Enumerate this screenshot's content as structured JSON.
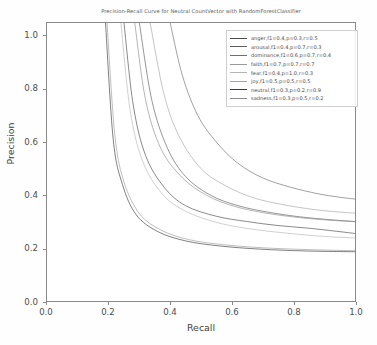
{
  "chart_data": {
    "type": "line",
    "title": "Precision-Recall Curve for Neutral  CountVector with RandomForestClassifier",
    "xlabel": "Recall",
    "ylabel": "Precision",
    "xlim": [
      0.0,
      1.0
    ],
    "ylim": [
      0.0,
      1.05
    ],
    "xticks": [
      "0.0",
      "0.2",
      "0.4",
      "0.6",
      "0.8",
      "1.0"
    ],
    "xtick_values": [
      0.0,
      0.2,
      0.4,
      0.6,
      0.8,
      1.0
    ],
    "yticks": [
      "0.0",
      "0.2",
      "0.4",
      "0.6",
      "0.8",
      "1.0"
    ],
    "ytick_values": [
      0.0,
      0.2,
      0.4,
      0.6,
      0.8,
      1.0
    ],
    "grid": false,
    "legend_position": "upper right",
    "series": [
      {
        "name": "anger,f1=0.4,p=0.3,r=0.5",
        "label": "anger,f1=0.4,p=0.3,r=0.5",
        "color": "#4a4a4a",
        "f1": 0.4,
        "precision": 0.3,
        "recall": 0.5,
        "asymptote_precision": 0.25,
        "knee_recall": 0.25,
        "x": [
          0.25,
          0.28,
          0.32,
          0.38,
          0.45,
          0.55,
          0.65,
          0.75,
          0.85,
          0.95,
          1.0
        ],
        "y": [
          1.05,
          0.74,
          0.55,
          0.43,
          0.36,
          0.32,
          0.3,
          0.285,
          0.275,
          0.262,
          0.255
        ]
      },
      {
        "name": "arousal,f1=0.4,p=0.7,r=0.3",
        "label": "arousal,f1=0.4,p=0.7,r=0.3",
        "color": "#5c5c5c",
        "f1": 0.4,
        "precision": 0.7,
        "recall": 0.3,
        "asymptote_precision": 0.3,
        "knee_recall": 0.3,
        "x": [
          0.3,
          0.34,
          0.39,
          0.45,
          0.53,
          0.62,
          0.72,
          0.82,
          0.92,
          1.0
        ],
        "y": [
          1.05,
          0.76,
          0.58,
          0.47,
          0.4,
          0.36,
          0.335,
          0.318,
          0.307,
          0.3
        ]
      },
      {
        "name": "dominance,f1=0.6,p=0.7,r=0.4",
        "label": "dominance,f1=0.6,p=0.7,r=0.4",
        "color": "#6e6e6e",
        "f1": 0.6,
        "precision": 0.7,
        "recall": 0.4,
        "asymptote_precision": 0.385,
        "knee_recall": 0.4,
        "x": [
          0.4,
          0.44,
          0.49,
          0.55,
          0.62,
          0.7,
          0.79,
          0.88,
          0.95,
          1.0
        ],
        "y": [
          1.05,
          0.85,
          0.7,
          0.6,
          0.52,
          0.465,
          0.43,
          0.405,
          0.392,
          0.385
        ]
      },
      {
        "name": "faith,f1=0.7,p=0.7,r=0.7",
        "label": "faith,f1=0.7,p=0.7,r=0.7",
        "color": "#9a9a9a",
        "f1": 0.7,
        "precision": 0.7,
        "recall": 0.7,
        "asymptote_precision": 0.19,
        "knee_recall": 0.195,
        "x": [
          0.195,
          0.22,
          0.25,
          0.3,
          0.37,
          0.46,
          0.57,
          0.7,
          0.85,
          1.0
        ],
        "y": [
          1.05,
          0.63,
          0.45,
          0.33,
          0.268,
          0.232,
          0.213,
          0.201,
          0.194,
          0.19
        ]
      },
      {
        "name": "fear,f1=0.4,p=1.0,r=0.3",
        "label": "fear,f1=0.4,p=1.0,r=0.3",
        "color": "#b6b6b6",
        "f1": 0.4,
        "precision": 1.0,
        "recall": 0.3,
        "asymptote_precision": 0.235,
        "knee_recall": 0.24,
        "x": [
          0.24,
          0.27,
          0.31,
          0.37,
          0.44,
          0.54,
          0.65,
          0.78,
          0.9,
          1.0
        ],
        "y": [
          1.05,
          0.72,
          0.53,
          0.41,
          0.345,
          0.3,
          0.274,
          0.256,
          0.244,
          0.238
        ]
      },
      {
        "name": "joy,f1=0.5,p=0.5,r=0.5",
        "label": "joy,f1=0.5,p=0.5,r=0.5",
        "color": "#a5a5a5",
        "f1": 0.5,
        "precision": 0.5,
        "recall": 0.5,
        "asymptote_precision": 0.33,
        "knee_recall": 0.335,
        "x": [
          0.335,
          0.38,
          0.43,
          0.5,
          0.58,
          0.67,
          0.77,
          0.87,
          0.95,
          1.0
        ],
        "y": [
          1.05,
          0.78,
          0.62,
          0.5,
          0.435,
          0.39,
          0.363,
          0.345,
          0.336,
          0.332
        ]
      },
      {
        "name": "neutral,f1=0.3,p=0.2,r=0.9",
        "label": "neutral,f1=0.3,p=0.2,r=0.9",
        "color": "#3a3a3a",
        "f1": 0.3,
        "precision": 0.2,
        "recall": 0.9,
        "asymptote_precision": 0.186,
        "knee_recall": 0.19,
        "x": [
          0.19,
          0.215,
          0.245,
          0.29,
          0.36,
          0.45,
          0.56,
          0.69,
          0.84,
          1.0
        ],
        "y": [
          1.05,
          0.61,
          0.44,
          0.325,
          0.262,
          0.227,
          0.208,
          0.196,
          0.189,
          0.186
        ]
      },
      {
        "name": "sadness,f1=0.3,p=0.5,r=0.2",
        "label": "sadness,f1=0.3,p=0.5,r=0.2",
        "color": "#8c8c8c",
        "f1": 0.3,
        "precision": 0.5,
        "recall": 0.2,
        "asymptote_precision": 0.3,
        "knee_recall": 0.285,
        "x": [
          0.285,
          0.32,
          0.37,
          0.44,
          0.52,
          0.61,
          0.71,
          0.82,
          0.92,
          1.0
        ],
        "y": [
          1.05,
          0.76,
          0.575,
          0.465,
          0.398,
          0.357,
          0.332,
          0.315,
          0.305,
          0.3
        ]
      }
    ]
  },
  "axes": {
    "xlabel": "Recall",
    "ylabel": "Precision"
  }
}
